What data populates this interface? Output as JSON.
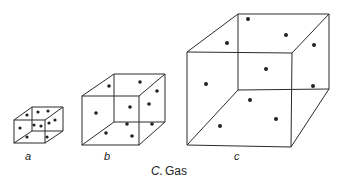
{
  "diagram": {
    "caption_prefix": "C.",
    "caption_word": "Gas",
    "cubes": [
      {
        "id": "a",
        "label": "a",
        "particle_count": 9
      },
      {
        "id": "b",
        "label": "b",
        "particle_count": 11
      },
      {
        "id": "c",
        "label": "c",
        "particle_count": 11
      }
    ],
    "colors": {
      "line": "#2a2a2a",
      "particle": "#222222",
      "background": "#ffffff"
    }
  }
}
